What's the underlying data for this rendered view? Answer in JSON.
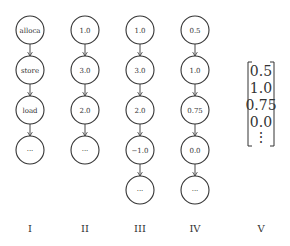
{
  "columns": [
    {
      "label": "I",
      "nodes": [
        "alloca",
        "store",
        "load",
        "···"
      ]
    },
    {
      "label": "II",
      "nodes": [
        "1.0",
        "3.0",
        "2.0",
        "···"
      ]
    },
    {
      "label": "III",
      "nodes": [
        "1.0",
        "3.0",
        "2.0",
        "−1.0",
        "···"
      ]
    },
    {
      "label": "IV",
      "nodes": [
        "0.5",
        "1.0",
        "0.75",
        "0.0",
        "···"
      ]
    }
  ],
  "vector": {
    "label": "V",
    "entries": [
      "0.5",
      "1.0",
      "0.75",
      "0.0",
      "⋮"
    ]
  }
}
